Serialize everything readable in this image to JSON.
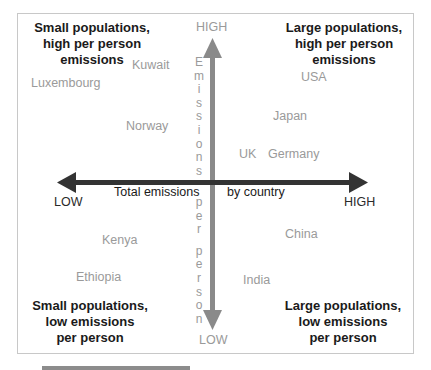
{
  "quadrants": {
    "top_left": [
      "Small populations,",
      "high per person",
      "emissions"
    ],
    "top_right": [
      "Large populations,",
      "high per person",
      "emissions"
    ],
    "bottom_left": [
      "Small populations,",
      "low emissions",
      "per person"
    ],
    "bottom_right": [
      "Large populations,",
      "low emissions",
      "per person"
    ]
  },
  "axes": {
    "horizontal": {
      "low_label": "LOW",
      "high_label": "HIGH",
      "caption_left": "Total emissions",
      "caption_right": "by country",
      "color": "#333333"
    },
    "vertical": {
      "high_label": "HIGH",
      "low_label": "LOW",
      "caption_upper": [
        "E",
        "m",
        "i",
        "s",
        "s",
        "i",
        "o",
        "n",
        "s"
      ],
      "caption_lower": [
        "p",
        "e",
        "r",
        "p",
        "e",
        "r",
        "s",
        "o",
        "n"
      ],
      "caption": "Emissions per person",
      "color": "#8a8a8a"
    }
  },
  "countries": {
    "kuwait": "Kuwait",
    "luxembourg": "Luxembourg",
    "norway": "Norway",
    "usa": "USA",
    "japan": "Japan",
    "uk": "UK",
    "germany": "Germany",
    "kenya": "Kenya",
    "ethiopia": "Ethiopia",
    "china": "China",
    "india": "India"
  },
  "colors": {
    "frame_border": "#c8c8c8",
    "country_label": "#9a9a9a",
    "quadrant_title": "#1a1a1a"
  }
}
